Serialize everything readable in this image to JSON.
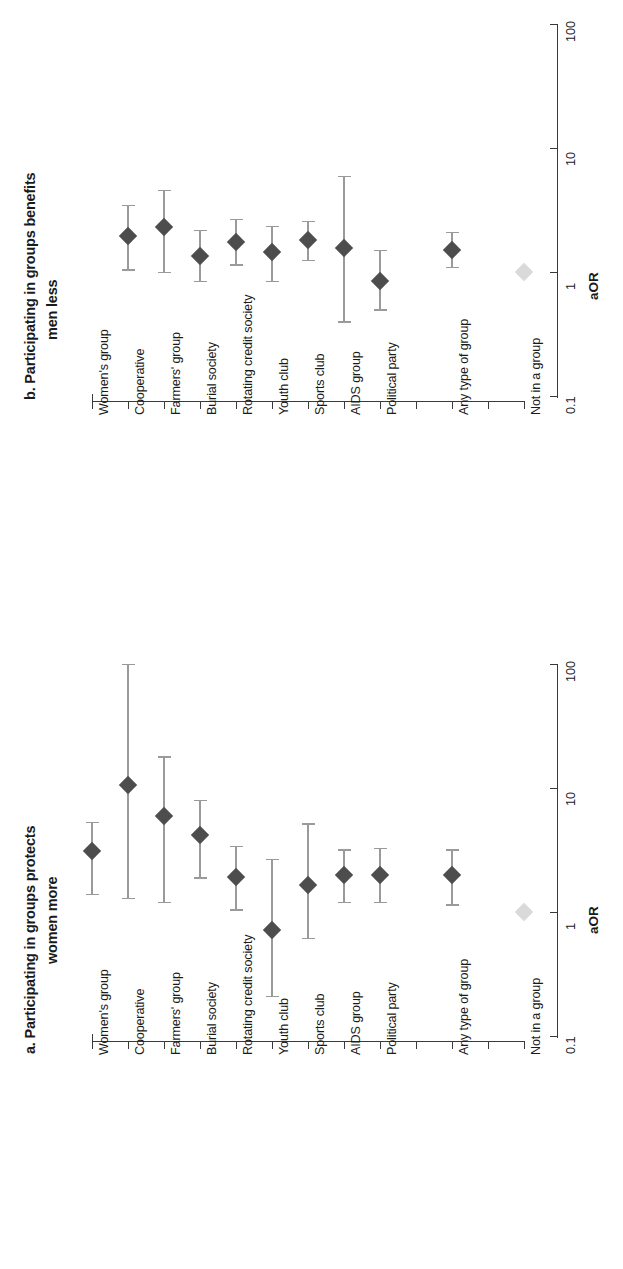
{
  "figure": {
    "orientation": "rotated-90",
    "value_axis_title": "aOR",
    "value_ticks": [
      "0.1",
      "1",
      "10",
      "100"
    ],
    "categories": [
      "Women's group",
      "Cooperative",
      "Farmers' group",
      "Burial society",
      "Rotating credit society",
      "Youth club",
      "Sports club",
      "AIDS group",
      "Political party",
      "Any type of group",
      "Not in a group"
    ]
  },
  "panel_a": {
    "title_line1": "a. Participating in groups protects",
    "title_line2": "women more"
  },
  "panel_b": {
    "title_line1": "b. Participating in groups benefits",
    "title_line2": "men less"
  },
  "chart_data": [
    {
      "type": "scatter",
      "id": "panel_a",
      "title": "a. Participating in groups protects women more",
      "xlabel": "aOR",
      "ylabel": "",
      "scale": "log10",
      "xlim": [
        0.1,
        100
      ],
      "xticks": [
        0.1,
        1,
        10,
        100
      ],
      "grid": false,
      "legend": "none",
      "reference_line": 1,
      "categories": [
        "Women's group",
        "Cooperative",
        "Farmers' group",
        "Burial society",
        "Rotating credit society",
        "Youth club",
        "Sports club",
        "AIDS group",
        "Political party",
        "Any type of group",
        "Not in a group"
      ],
      "points": [
        {
          "category": "Women's group",
          "aOR": 3.1,
          "ci_low": 1.4,
          "ci_high": 5.3,
          "reference": false
        },
        {
          "category": "Cooperative",
          "aOR": 10.5,
          "ci_low": 1.3,
          "ci_high": 100.0,
          "reference": false
        },
        {
          "category": "Farmers' group",
          "aOR": 5.9,
          "ci_low": 1.2,
          "ci_high": 18.0,
          "reference": false
        },
        {
          "category": "Burial society",
          "aOR": 4.2,
          "ci_low": 1.9,
          "ci_high": 8.0,
          "reference": false
        },
        {
          "category": "Rotating credit society",
          "aOR": 1.9,
          "ci_low": 1.05,
          "ci_high": 3.4,
          "reference": false
        },
        {
          "category": "Youth club",
          "aOR": 0.72,
          "ci_low": 0.21,
          "ci_high": 2.7,
          "reference": false
        },
        {
          "category": "Sports club",
          "aOR": 1.65,
          "ci_low": 0.62,
          "ci_high": 5.2,
          "reference": false
        },
        {
          "category": "AIDS group",
          "aOR": 2.0,
          "ci_low": 1.2,
          "ci_high": 3.2,
          "reference": false
        },
        {
          "category": "Political party",
          "aOR": 2.0,
          "ci_low": 1.2,
          "ci_high": 3.3,
          "reference": false
        },
        {
          "category": "Any type of group",
          "aOR": 2.0,
          "ci_low": 1.15,
          "ci_high": 3.2,
          "reference": false
        },
        {
          "category": "Not in a group",
          "aOR": 1.0,
          "ci_low": 1.0,
          "ci_high": 1.0,
          "reference": true
        }
      ]
    },
    {
      "type": "scatter",
      "id": "panel_b",
      "title": "b. Participating in groups benefits men less",
      "xlabel": "aOR",
      "ylabel": "",
      "scale": "log10",
      "xlim": [
        0.1,
        100
      ],
      "xticks": [
        0.1,
        1,
        10,
        100
      ],
      "grid": false,
      "legend": "none",
      "reference_line": 1,
      "categories": [
        "Women's group",
        "Cooperative",
        "Farmers' group",
        "Burial society",
        "Rotating credit society",
        "Youth club",
        "Sports club",
        "AIDS group",
        "Political party",
        "Any type of group",
        "Not in a group"
      ],
      "points": [
        {
          "category": "Women's group",
          "aOR": null,
          "ci_low": null,
          "ci_high": null,
          "reference": false
        },
        {
          "category": "Cooperative",
          "aOR": 1.95,
          "ci_low": 1.05,
          "ci_high": 3.5,
          "reference": false
        },
        {
          "category": "Farmers' group",
          "aOR": 2.3,
          "ci_low": 1.0,
          "ci_high": 4.6,
          "reference": false
        },
        {
          "category": "Burial society",
          "aOR": 1.35,
          "ci_low": 0.85,
          "ci_high": 2.2,
          "reference": false
        },
        {
          "category": "Rotating credit society",
          "aOR": 1.75,
          "ci_low": 1.15,
          "ci_high": 2.7,
          "reference": false
        },
        {
          "category": "Youth club",
          "aOR": 1.45,
          "ci_low": 0.85,
          "ci_high": 2.35,
          "reference": false
        },
        {
          "category": "Sports club",
          "aOR": 1.8,
          "ci_low": 1.25,
          "ci_high": 2.6,
          "reference": false
        },
        {
          "category": "AIDS group",
          "aOR": 1.55,
          "ci_low": 0.4,
          "ci_high": 6.0,
          "reference": false
        },
        {
          "category": "Political party",
          "aOR": 0.85,
          "ci_low": 0.5,
          "ci_high": 1.5,
          "reference": false
        },
        {
          "category": "Any type of group",
          "aOR": 1.5,
          "ci_low": 1.1,
          "ci_high": 2.1,
          "reference": false
        },
        {
          "category": "Not in a group",
          "aOR": 1.0,
          "ci_low": 1.0,
          "ci_high": 1.0,
          "reference": true
        }
      ]
    }
  ]
}
